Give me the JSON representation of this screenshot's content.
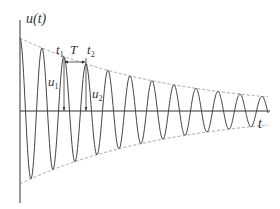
{
  "diagram": {
    "type": "damped-oscillation",
    "y_axis_label": "u(t)",
    "x_axis_label": "t",
    "markers": {
      "t1": {
        "label": "t",
        "sub": "1"
      },
      "t2": {
        "label": "t",
        "sub": "2"
      },
      "period": "T",
      "u1": {
        "label": "u",
        "sub": "1"
      },
      "u2": {
        "label": "u",
        "sub": "2"
      }
    },
    "style": {
      "curve_color": "#444444",
      "axis_color": "#333333",
      "envelope_color": "#888888"
    }
  }
}
